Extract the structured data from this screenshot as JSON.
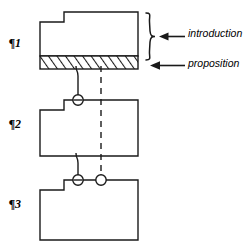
{
  "diagram": {
    "type": "paragraph-structure-schematic",
    "title": "",
    "stroke_color": "#1a1a1a",
    "background_color": "#ffffff",
    "paragraph_labels": [
      {
        "id": "p1",
        "text": "¶1"
      },
      {
        "id": "p2",
        "text": "¶2"
      },
      {
        "id": "p3",
        "text": "¶3"
      }
    ],
    "annotations": [
      {
        "id": "introduction",
        "text": "introduction",
        "pointer": "arrow-left",
        "bracket": "curly-brace-right",
        "target": "paragraph-1-upper-region"
      },
      {
        "id": "proposition",
        "text": "proposition",
        "pointer": "arrow-left",
        "bracket": "none",
        "target": "paragraph-1-hatched-band"
      }
    ],
    "blocks": [
      {
        "id": "paragraph-1-block",
        "label": "¶1",
        "shape": "notched-rectangle",
        "notch": "top-left",
        "hatched_band": "bottom",
        "hatch_pattern": "diagonal-stripes"
      },
      {
        "id": "paragraph-2-block",
        "label": "¶2",
        "shape": "notched-rectangle",
        "notch": "top-left",
        "hatched_band": "none",
        "hatch_pattern": "none"
      },
      {
        "id": "paragraph-3-block",
        "label": "¶3",
        "shape": "notched-rectangle",
        "notch": "top-left",
        "hatched_band": "none",
        "hatch_pattern": "none"
      }
    ],
    "connectors": [
      {
        "id": "connector-solid-p1-p2",
        "style": "solid",
        "from": "paragraph-1-hatched-band",
        "to": "paragraph-2-top-edge",
        "end_marker": "circle"
      },
      {
        "id": "connector-solid-p2-p3",
        "style": "solid",
        "from": "paragraph-2-bottom-edge",
        "to": "paragraph-3-top-edge",
        "end_marker": "circle"
      },
      {
        "id": "connector-dashed-p1-p3",
        "style": "dashed",
        "from": "paragraph-1-hatched-band",
        "to": "paragraph-3-top-edge",
        "end_marker": "circle"
      }
    ]
  }
}
